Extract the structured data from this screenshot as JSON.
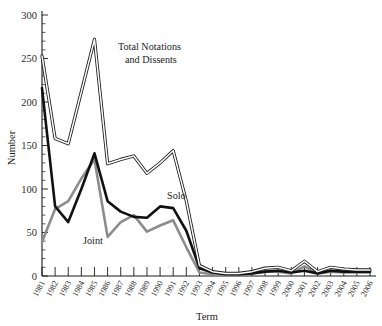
{
  "chart_data": {
    "type": "line",
    "title": "",
    "xlabel": "Term",
    "ylabel": "Number",
    "xlim": [
      1981,
      2006
    ],
    "ylim": [
      0,
      300
    ],
    "grid": false,
    "legend_position": "inline-annotations",
    "categories": [
      "1981",
      "1982",
      "1983",
      "1984",
      "1985",
      "1986",
      "1987",
      "1988",
      "1989",
      "1990",
      "1991",
      "1992",
      "1993",
      "1994",
      "1995",
      "1996",
      "1997",
      "1998",
      "1999",
      "2000",
      "2001",
      "2002",
      "2003",
      "2004",
      "2005",
      "2006"
    ],
    "ytick_labels": [
      "0",
      "50",
      "100",
      "150",
      "200",
      "250",
      "300"
    ],
    "ytick_values": [
      0,
      50,
      100,
      150,
      200,
      250,
      300
    ],
    "series": [
      {
        "name": "Total Notations and Dissents",
        "style": "outline-white",
        "color": "#ffffff",
        "stroke": "#1a1a1a",
        "values": [
          253,
          158,
          152,
          212,
          272,
          129,
          134,
          138,
          118,
          130,
          144,
          86,
          12,
          5,
          3,
          3,
          5,
          9,
          10,
          6,
          17,
          5,
          10,
          8,
          7,
          7
        ]
      },
      {
        "name": "Solo",
        "style": "thick-black",
        "color": "#111111",
        "values": [
          216,
          80,
          62,
          100,
          141,
          86,
          74,
          68,
          67,
          80,
          78,
          52,
          9,
          4,
          2,
          2,
          3,
          5,
          6,
          4,
          6,
          3,
          6,
          5,
          5,
          5
        ]
      },
      {
        "name": "Joint",
        "style": "thick-gray",
        "color": "#8c8c8c",
        "values": [
          39,
          77,
          86,
          112,
          134,
          45,
          62,
          70,
          51,
          58,
          64,
          33,
          4,
          2,
          2,
          2,
          3,
          5,
          5,
          3,
          11,
          3,
          5,
          4,
          4,
          4
        ]
      }
    ],
    "annotations": [
      {
        "text": "Total Notations",
        "x": 118,
        "y": 50
      },
      {
        "text": "and Dissents",
        "x": 125,
        "y": 63
      },
      {
        "text": "Solo",
        "x": 167,
        "y": 199
      },
      {
        "text": "Joint",
        "x": 83,
        "y": 244
      }
    ]
  },
  "axes": {
    "y_title": "Number",
    "x_title": "Term"
  }
}
